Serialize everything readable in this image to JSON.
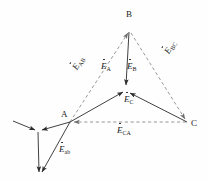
{
  "figure": {
    "type": "phasor-diagram",
    "title": "",
    "vertices": [
      {
        "name": "B",
        "label": "B",
        "x": 129,
        "y": 28
      },
      {
        "name": "A",
        "label": "A",
        "x": 70,
        "y": 122
      },
      {
        "name": "C",
        "label": "C",
        "x": 187,
        "y": 122
      },
      {
        "name": "N",
        "label": "",
        "x": 126,
        "y": 90
      },
      {
        "name": "S",
        "label": "",
        "x": 38,
        "y": 132
      }
    ],
    "phase_phasors": [
      {
        "name": "E_A",
        "base": "E",
        "sub": "A",
        "from": "A",
        "to": "N",
        "style": "solid",
        "label_x": 104,
        "label_y": 64
      },
      {
        "name": "E_B",
        "base": "E",
        "sub": "B",
        "from": "B",
        "to": "N",
        "style": "solid",
        "label_x": 129,
        "label_y": 64
      },
      {
        "name": "E_C",
        "base": "E",
        "sub": "C",
        "from": "C",
        "to": "N",
        "style": "solid",
        "label_x": 126,
        "label_y": 97
      }
    ],
    "line_phasors": [
      {
        "name": "E_AB",
        "base": "E",
        "sub": "AB",
        "from": "A",
        "to": "B",
        "style": "dashed",
        "label_x": 75,
        "label_y": 57
      },
      {
        "name": "E_BC",
        "base": "E",
        "sub": "BC",
        "from": "B",
        "to": "C",
        "style": "dashed",
        "label_x": 166,
        "label_y": 55
      },
      {
        "name": "E_CA",
        "base": "E",
        "sub": "CA",
        "from": "C",
        "to": "A",
        "style": "dashed",
        "label_x": 119,
        "label_y": 128
      }
    ],
    "secondary_phasors": [
      {
        "name": "E_ab",
        "base": "E",
        "sub": "ab",
        "from": "A",
        "to": "S_bottom",
        "style": "solid",
        "label_x": 62,
        "label_y": 147
      }
    ],
    "star_arrows": [
      {
        "name": "star-arm-left",
        "from_x": 13,
        "from_y": 121,
        "to_x": 38,
        "to_y": 132
      },
      {
        "name": "star-arm-right",
        "from_x": 70,
        "from_y": 122,
        "to_x": 38,
        "to_y": 132
      },
      {
        "name": "star-arm-down",
        "from_x": 38,
        "from_y": 132,
        "to_x": 39,
        "to_y": 175
      }
    ],
    "colors": {
      "stroke_solid": "#2b2b2b",
      "stroke_dashed": "#8c8c8c",
      "text": "#1a1a1a",
      "background": "#fefefe"
    }
  }
}
